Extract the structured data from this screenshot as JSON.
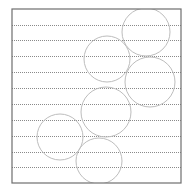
{
  "canvas": {
    "width": 187,
    "height": 193,
    "background": "#ffffff"
  },
  "frame": {
    "x": 12,
    "y": 9,
    "width": 169,
    "height": 174,
    "stroke": "#6e6e6e",
    "stroke_width": 1.2
  },
  "lines": {
    "stroke": "#8a8a8a",
    "dash": "1 1",
    "y_positions": [
      25,
      40,
      56,
      72,
      88,
      104,
      120,
      136,
      152,
      167
    ]
  },
  "circles": {
    "stroke": "#bdbdbd",
    "items": [
      {
        "cx": 146,
        "cy": 32,
        "r": 24
      },
      {
        "cx": 107,
        "cy": 59,
        "r": 23
      },
      {
        "cx": 150,
        "cy": 82,
        "r": 25
      },
      {
        "cx": 106,
        "cy": 112,
        "r": 25
      },
      {
        "cx": 60,
        "cy": 137,
        "r": 23
      },
      {
        "cx": 99,
        "cy": 161,
        "r": 23
      }
    ]
  }
}
